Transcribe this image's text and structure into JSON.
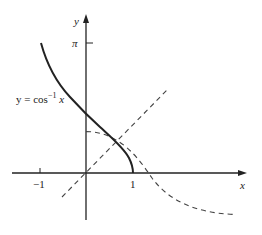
{
  "diagram": {
    "curve_label_prefix": "y = cos",
    "curve_label_exp": "−1",
    "curve_label_var": "x",
    "x_axis_label": "x",
    "y_axis_label": "y",
    "ticks": {
      "x_neg_one": "−1",
      "x_one": "1",
      "y_pi": "π"
    },
    "elements": [
      {
        "name": "arccos-curve",
        "style": "solid",
        "description": "y = cos^-1 x for x in [-1,1]"
      },
      {
        "name": "cos-curve",
        "style": "dashed",
        "description": "y = cos x for x in [0, π]"
      },
      {
        "name": "identity-line",
        "style": "dashed",
        "description": "y = x"
      }
    ],
    "colors": {
      "ink": "#222222",
      "dash": "#444444",
      "background": "#ffffff"
    }
  }
}
